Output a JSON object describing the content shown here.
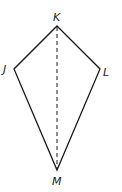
{
  "figure": {
    "type": "kite",
    "vertices": {
      "K": {
        "label": "K",
        "x": 57,
        "y": 26
      },
      "J": {
        "label": "J",
        "x": 14,
        "y": 69
      },
      "L": {
        "label": "L",
        "x": 100,
        "y": 69
      },
      "M": {
        "label": "M",
        "x": 57,
        "y": 170
      }
    },
    "diagonal": {
      "from": "K",
      "to": "M",
      "style": "dashed"
    },
    "colors": {
      "stroke": "#1a1a1a",
      "background": "#ffffff"
    }
  }
}
